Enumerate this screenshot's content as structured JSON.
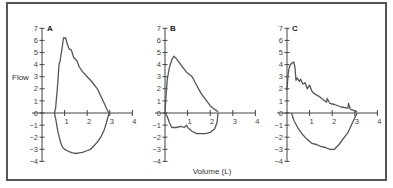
{
  "chart_data": [
    {
      "type": "line",
      "panel": "A",
      "title": "A",
      "xlabel": "Volume (L)",
      "ylabel": "Flow",
      "xlim": [
        0,
        4
      ],
      "ylim": [
        -4,
        7
      ],
      "xticks": [
        1,
        2,
        3,
        4
      ],
      "yticks": [
        -4,
        -3,
        -2,
        -1,
        0,
        1,
        2,
        3,
        4,
        5,
        6,
        7
      ],
      "grid": false,
      "series": [
        {
          "name": "Expiratory",
          "x": [
            0.55,
            0.6,
            0.7,
            0.75,
            0.8,
            0.9,
            0.95,
            1.05,
            1.1,
            1.2,
            1.3,
            1.4,
            1.55,
            1.65,
            1.8,
            2.0,
            2.2,
            2.45,
            2.6,
            2.75,
            2.9,
            2.97
          ],
          "y": [
            0,
            0.4,
            2.5,
            4.0,
            4.3,
            5.5,
            6.2,
            6.2,
            5.8,
            5.3,
            5.2,
            4.6,
            4.3,
            3.8,
            3.4,
            3.0,
            2.6,
            2.0,
            1.4,
            0.8,
            0.2,
            0
          ]
        },
        {
          "name": "Inspiratory",
          "x": [
            0.55,
            0.62,
            0.7,
            0.8,
            0.9,
            1.0,
            1.1,
            1.2,
            1.35,
            1.5,
            1.65,
            1.8,
            2.0,
            2.15,
            2.3,
            2.45,
            2.6,
            2.75,
            2.85,
            2.92,
            2.97
          ],
          "y": [
            0,
            -0.6,
            -1.5,
            -2.3,
            -2.8,
            -3.0,
            -3.1,
            -3.2,
            -3.3,
            -3.35,
            -3.3,
            -3.25,
            -3.1,
            -3.0,
            -2.7,
            -2.4,
            -2.0,
            -1.4,
            -0.8,
            -0.3,
            0
          ]
        }
      ]
    },
    {
      "type": "line",
      "panel": "B",
      "title": "B",
      "xlabel": "Volume (L)",
      "ylabel": "Flow",
      "xlim": [
        0,
        4
      ],
      "ylim": [
        -4,
        7
      ],
      "xticks": [
        1,
        2,
        3,
        4
      ],
      "yticks": [
        -4,
        -3,
        -2,
        -1,
        0,
        1,
        2,
        3,
        4,
        5,
        6,
        7
      ],
      "grid": false,
      "series": [
        {
          "name": "Expiratory",
          "x": [
            0.0,
            0.05,
            0.1,
            0.2,
            0.3,
            0.4,
            0.5,
            0.7,
            0.9,
            1.0,
            1.2,
            1.4,
            1.6,
            1.8,
            2.0,
            2.2,
            2.35
          ],
          "y": [
            0,
            1.5,
            2.8,
            3.8,
            4.4,
            4.7,
            4.5,
            4.0,
            3.5,
            3.3,
            3.0,
            2.3,
            1.6,
            1.1,
            0.6,
            0.3,
            0.1
          ]
        },
        {
          "name": "Inspiratory",
          "x": [
            0.0,
            0.1,
            0.2,
            0.3,
            0.5,
            0.7,
            0.85,
            0.95,
            1.0,
            1.2,
            1.4,
            1.6,
            1.8,
            2.0,
            2.2,
            2.3,
            2.35
          ],
          "y": [
            0,
            -0.3,
            -0.8,
            -1.2,
            -1.2,
            -1.1,
            -1.2,
            -1.0,
            -1.2,
            -1.5,
            -1.7,
            -1.7,
            -1.7,
            -1.6,
            -1.3,
            -0.8,
            0
          ]
        }
      ]
    },
    {
      "type": "line",
      "panel": "C",
      "title": "C",
      "xlabel": "Volume (L)",
      "ylabel": "Flow",
      "xlim": [
        0,
        4
      ],
      "ylim": [
        -4,
        7
      ],
      "xticks": [
        1,
        2,
        3,
        4
      ],
      "yticks": [
        -4,
        -3,
        -2,
        -1,
        0,
        1,
        2,
        3,
        4,
        5,
        6,
        7
      ],
      "grid": false,
      "series": [
        {
          "name": "Expiratory",
          "x": [
            0.0,
            0.05,
            0.1,
            0.2,
            0.3,
            0.35,
            0.4,
            0.45,
            0.55,
            0.6,
            0.7,
            0.8,
            0.9,
            1.0,
            1.1,
            1.2,
            1.4,
            1.6,
            1.75,
            1.78,
            1.9,
            2.1,
            2.4,
            2.7,
            2.72,
            2.8,
            3.0,
            3.1
          ],
          "y": [
            1.9,
            3.2,
            3.8,
            4.1,
            4.2,
            3.8,
            2.7,
            2.9,
            2.6,
            2.8,
            2.4,
            2.5,
            2.0,
            2.3,
            1.8,
            1.6,
            1.4,
            1.1,
            0.9,
            1.2,
            0.8,
            0.7,
            0.5,
            0.4,
            0.8,
            0.3,
            0.2,
            0.1
          ]
        },
        {
          "name": "Inspiratory",
          "x": [
            0.2,
            0.3,
            0.5,
            0.7,
            0.9,
            1.1,
            1.3,
            1.5,
            1.7,
            1.9,
            2.1,
            2.3,
            2.5,
            2.7,
            2.85,
            3.0,
            3.1
          ],
          "y": [
            0,
            -0.6,
            -1.3,
            -1.8,
            -2.2,
            -2.5,
            -2.6,
            -2.75,
            -2.85,
            -3.0,
            -3.0,
            -2.6,
            -2.1,
            -1.6,
            -1.0,
            -0.4,
            0
          ]
        }
      ]
    }
  ],
  "figure": {
    "ylabel": "Flow",
    "xlabel": "Volume (L)",
    "panels": [
      "A",
      "B",
      "C"
    ],
    "xtick_labels": [
      "1",
      "2",
      "3",
      "4"
    ],
    "ytick_labels": [
      "7",
      "6",
      "5",
      "4",
      "3",
      "2",
      "1",
      "0",
      "−1",
      "−2",
      "−3",
      "−4"
    ]
  }
}
